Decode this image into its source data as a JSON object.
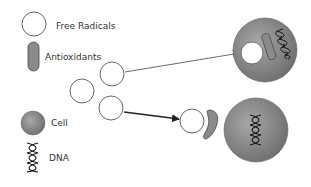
{
  "legend": {
    "items": [
      {
        "key": "free_radical",
        "label": "Free Radicals",
        "icon": "free-radical-circle-icon"
      },
      {
        "key": "antioxidant",
        "label": "Antioxidants",
        "icon": "antioxidant-pill-icon"
      },
      {
        "key": "cell",
        "label": "Cell",
        "icon": "cell-sphere-icon"
      },
      {
        "key": "dna",
        "label": "DNA",
        "icon": "dna-helix-icon"
      }
    ]
  },
  "colors": {
    "outline": "#555555",
    "cell_light": "#a6a6a6",
    "cell_dark": "#6e6e6e",
    "antioxidant_fill": "#8a8a8a",
    "free_radical_fill": "#ffffff",
    "arrow": "#333333",
    "text": "#333333"
  },
  "scene": {
    "free_radicals_unbound": 3,
    "top_path": "free radical enters cell and damages DNA (no antioxidant protection)",
    "bottom_path": "antioxidant neutralizes free radical before it reaches cell"
  }
}
